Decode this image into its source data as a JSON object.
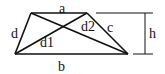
{
  "diagram": {
    "type": "trapezoid",
    "labels": {
      "top_base": "a",
      "bottom_base": "b",
      "right_leg": "c",
      "left_leg": "d",
      "diagonal_1": "d1",
      "diagonal_2": "d2",
      "height": "h"
    },
    "colors": {
      "stroke": "#111111",
      "background": "#ffffff"
    }
  }
}
